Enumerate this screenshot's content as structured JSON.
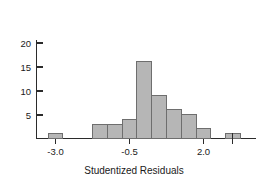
{
  "chart_data": {
    "type": "bar",
    "title": "",
    "subtitle": "",
    "xlabel": "Studentized Residuals",
    "ylabel": "",
    "grid": false,
    "legend": false,
    "legend_position": "none",
    "xlim": [
      -3.75,
      3.15
    ],
    "ylim": [
      0,
      21
    ],
    "bin_width": 0.5,
    "x_ticks": [
      -3.0,
      -0.5,
      2.0
    ],
    "x_tick_labels": [
      "-3.0",
      "-0.5",
      "2.0"
    ],
    "x_minor_ticks": [
      3.0
    ],
    "y_ticks": [
      5,
      10,
      15,
      20
    ],
    "y_tick_labels": [
      "5",
      "10",
      "15",
      "20"
    ],
    "bins": [
      {
        "left": -3.25,
        "right": -2.75,
        "count": 1
      },
      {
        "left": -2.75,
        "right": -2.25,
        "count": 0
      },
      {
        "left": -2.25,
        "right": -1.75,
        "count": 0
      },
      {
        "left": -1.75,
        "right": -1.25,
        "count": 3
      },
      {
        "left": -1.25,
        "right": -0.75,
        "count": 3
      },
      {
        "left": -0.75,
        "right": -0.25,
        "count": 4
      },
      {
        "left": -0.25,
        "right": 0.25,
        "count": 16
      },
      {
        "left": 0.25,
        "right": 0.75,
        "count": 9
      },
      {
        "left": 0.75,
        "right": 1.25,
        "count": 6
      },
      {
        "left": 1.25,
        "right": 1.75,
        "count": 5
      },
      {
        "left": 1.75,
        "right": 2.25,
        "count": 2
      },
      {
        "left": 2.25,
        "right": 2.75,
        "count": 0
      },
      {
        "left": 2.75,
        "right": 3.25,
        "count": 1
      }
    ],
    "categories": [
      "-3.0",
      "-2.5",
      "-2.0",
      "-1.5",
      "-1.0",
      "-0.5",
      "0.0",
      "0.5",
      "1.0",
      "1.5",
      "2.0",
      "2.5",
      "3.0"
    ],
    "values": [
      1,
      0,
      0,
      3,
      3,
      4,
      16,
      9,
      6,
      5,
      2,
      0,
      1
    ],
    "colors": {
      "bar_fill": "#b6b6b6",
      "bar_stroke": "#6e6e6e",
      "axis": "#2b2b2b",
      "text": "#1a1a1a",
      "background": "#ffffff"
    }
  }
}
